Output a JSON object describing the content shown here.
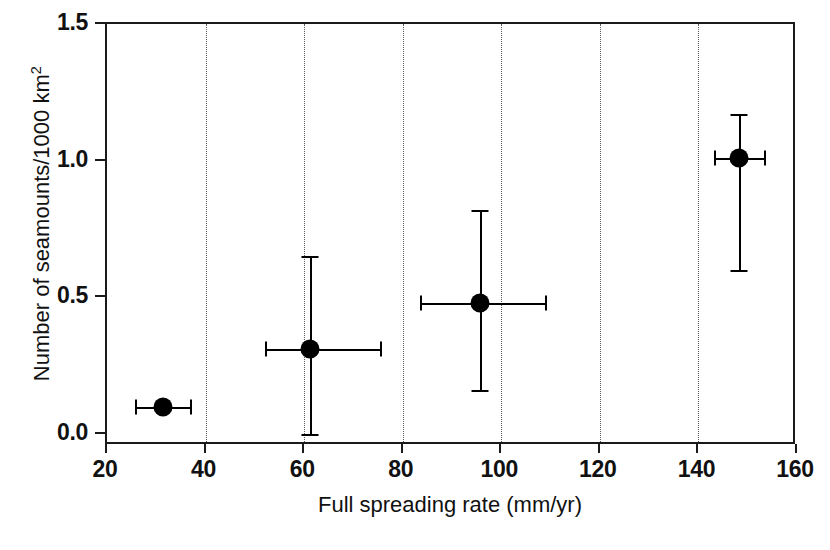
{
  "chart_data": {
    "type": "scatter",
    "title": "",
    "xlabel": "Full spreading rate (mm/yr)",
    "ylabel": "Number of seamounts/1000 km",
    "ylabel_superscript": "2",
    "xlim": [
      20,
      160
    ],
    "ylim": [
      0.0,
      1.5
    ],
    "xticks": [
      20,
      40,
      60,
      80,
      100,
      120,
      140,
      160
    ],
    "xticklabels": [
      "20",
      "40",
      "60",
      "80",
      "100",
      "120",
      "140",
      "160"
    ],
    "yticks": [
      0.0,
      0.5,
      1.0,
      1.5
    ],
    "yticklabels": [
      "0.0",
      "0.5",
      "1.0",
      "1.5"
    ],
    "gridlines_x": [
      40,
      60,
      80,
      100,
      120,
      140
    ],
    "gridlines_y": [],
    "grid": true,
    "grid_style": "dotted",
    "legend": null,
    "marker_color": "#000000",
    "axis_color": "#1a1a1a",
    "grid_color": "#5a5a5a",
    "points": [
      {
        "label": "point-1",
        "x": 31.4,
        "y": 0.1,
        "xerr_low": 25.7,
        "xerr_high": 36.8,
        "yerr_low": null,
        "yerr_high": null
      },
      {
        "label": "point-2",
        "x": 61.2,
        "y": 0.31,
        "xerr_low": 52.0,
        "xerr_high": 75.4,
        "yerr_low": 0.0,
        "yerr_high": 0.65
      },
      {
        "label": "point-3",
        "x": 95.7,
        "y": 0.48,
        "xerr_low": 83.5,
        "xerr_high": 108.9,
        "yerr_low": 0.16,
        "yerr_high": 0.82
      },
      {
        "label": "point-4",
        "x": 148.2,
        "y": 1.01,
        "xerr_low": 143.1,
        "xerr_high": 153.3,
        "yerr_low": 0.6,
        "yerr_high": 1.17
      }
    ]
  }
}
